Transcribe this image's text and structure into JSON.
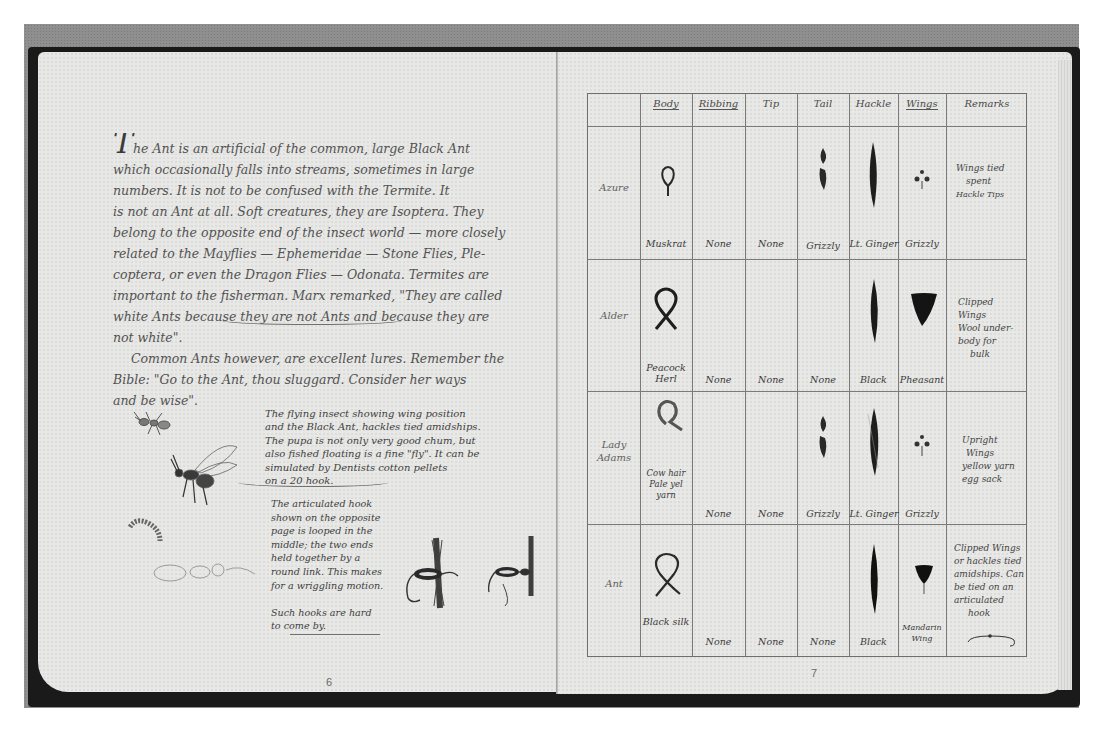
{
  "figure": {
    "caption_note": "",
    "photo_bg": "#8f8f8f",
    "page_color": "#e8e8e6",
    "ink_color": "#3a3a3a"
  },
  "left_page": {
    "page_number": "6",
    "essay_lines": [
      "The Ant is an artificial of the common, large Black Ant",
      "which occasionally falls into streams, sometimes in large",
      "numbers. It is not to be confused with the Termite. It",
      "is not an Ant at all. Soft creatures, they are Isoptera. They",
      "belong to the opposite end of the insect world — more closely",
      "related to the Mayflies — Ephemeridae — Stone Flies, Ple-",
      "coptera, or even the Dragon Flies — Odonata. Termites are",
      "important to the fisherman. Marx remarked, \"They are called",
      "white Ants because they are not Ants and because they are",
      "not white\".",
      "Common Ants however, are excellent lures. Remember the",
      "Bible: \"Go to the Ant, thou sluggard. Consider her ways",
      "and be wise\"."
    ],
    "notes_block_1": [
      "The flying insect showing wing position",
      "and the Black Ant, hackles tied amidships.",
      "The pupa is not only very good chum, but",
      "also fished floating is a fine \"fly\". It can be",
      "simulated by Dentists cotton pellets",
      "on a 20 hook."
    ],
    "notes_block_2": [
      "The articulated hook",
      "shown on the opposite",
      "page is looped in the",
      "middle; the two ends",
      "held together by a",
      "round link. This makes",
      "for a wriggling motion.",
      "",
      "Such hooks are hard",
      "to come by."
    ],
    "illustrations": [
      "ant-sketch",
      "winged-ant-sketch",
      "larva-sketch",
      "pupa-sketch",
      "articulated-fly-1",
      "articulated-fly-2"
    ]
  },
  "right_page": {
    "page_number": "7",
    "table": {
      "columns": [
        "",
        "Body",
        "Ribbing",
        "Tip",
        "Tail",
        "Hackle",
        "Wings",
        "Remarks"
      ],
      "rows": [
        {
          "name": "Azure",
          "body": "Muskrat",
          "ribbing": "None",
          "tip": "None",
          "tail": "Grizzly",
          "hackle": "Lt. Ginger",
          "wings": "Grizzly",
          "remarks": [
            "Wings tied",
            "spent",
            "Hackle Tips"
          ]
        },
        {
          "name": "Alder",
          "body": "Peacock Herl",
          "ribbing": "None",
          "tip": "None",
          "tail": "None",
          "hackle": "Black",
          "wings": "Pheasant",
          "remarks": [
            "Clipped",
            "Wings",
            "Wool under-",
            "body for",
            "bulk"
          ]
        },
        {
          "name": "Lady Adams",
          "body": "Cow hair Pale yel yarn",
          "ribbing": "None",
          "tip": "None",
          "tail": "Grizzly",
          "hackle": "Lt. Ginger",
          "wings": "Grizzly",
          "remarks": [
            "Upright",
            "Wings",
            "yellow yarn",
            "egg sack"
          ]
        },
        {
          "name": "Ant",
          "body": "Black silk",
          "ribbing": "None",
          "tip": "None",
          "tail": "None",
          "hackle": "Black",
          "wings": "Mandarin Wing",
          "remarks": [
            "Clipped Wings",
            "or hackles tied",
            "amidships. Can",
            "be tied on an",
            "articulated",
            "hook"
          ]
        }
      ]
    }
  }
}
